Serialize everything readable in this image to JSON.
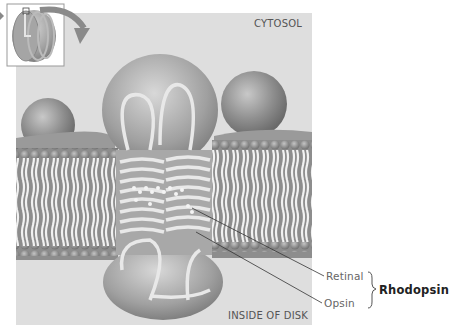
{
  "labels": {
    "cytosol": "CYTOSOL",
    "inside_of_disk": "INSIDE OF DISK",
    "retinal": "Retinal",
    "opsin": "Opsin",
    "rhodopsin": "Rhodopsin"
  },
  "inset": {
    "description": "Rod disk stack thumbnail with curved arrow indicating zoomed region"
  },
  "colors": {
    "panel_background": "#dedede",
    "membrane": "#9a9a9a",
    "protein": "#b0b0b0"
  }
}
